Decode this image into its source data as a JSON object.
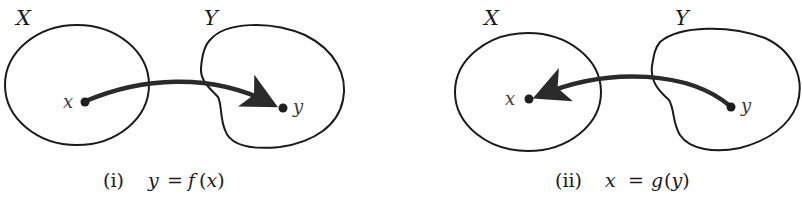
{
  "figure": {
    "panels": [
      {
        "id": "i",
        "set_labels": {
          "domain": "X",
          "codomain": "Y"
        },
        "point_labels": {
          "x": "x",
          "y": "y"
        },
        "arrow_direction": "x-to-y",
        "caption": {
          "number": "(i)",
          "lhs": "y",
          "eq": "=",
          "fn": "f",
          "arg": "x"
        }
      },
      {
        "id": "ii",
        "set_labels": {
          "domain": "X",
          "codomain": "Y"
        },
        "point_labels": {
          "x": "x",
          "y": "y"
        },
        "arrow_direction": "y-to-x",
        "caption": {
          "number": "(ii)",
          "lhs": "x",
          "eq": "=",
          "fn": "g",
          "arg": "y"
        }
      }
    ],
    "colors": {
      "ink": "#1a1a1a",
      "background": "#ffffff"
    }
  }
}
